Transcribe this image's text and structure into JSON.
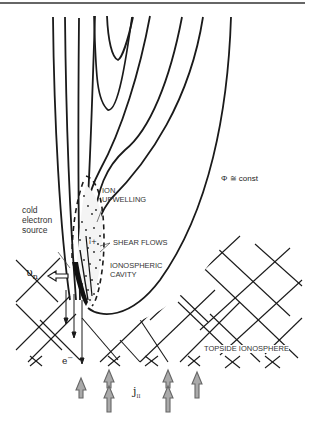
{
  "figure": {
    "top_rule": true,
    "labels": {
      "phi_const": "Φ ≅ const",
      "ion_upwelling_line1": "ION",
      "ion_upwelling_line2": "UPWELLING",
      "cold_line1": "cold",
      "cold_line2": "electron",
      "cold_line3": "source",
      "shear_flows": "SHEAR FLOWS",
      "cavity_line1": "IONOSPHERIC",
      "cavity_line2": "CAVITY",
      "v_n": "υ",
      "v_n_sub": "n",
      "electron": "e",
      "electron_sup": "−",
      "j_par": "j",
      "j_par_sub": "II",
      "topside": "TOPSIDE IONOSPHERE"
    },
    "elements": {
      "equipotential_contours": 8,
      "dashed_boundary": "ion upwelling region",
      "stippled_region": "ionospheric cavity / cold electron source",
      "upward_current_arrows": 4,
      "downward_electron_arrows": 3,
      "neutral_wind_arrow": "left",
      "lattice": "topside ionosphere cross-hatch"
    },
    "colors": {
      "line": "#1a1a1a",
      "text": "#333333",
      "current_arrow": "#888888"
    }
  }
}
